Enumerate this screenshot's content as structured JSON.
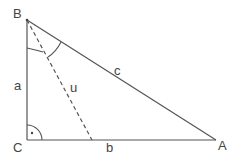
{
  "diagram": {
    "type": "right-triangle",
    "vertices": {
      "B": {
        "label": "B",
        "x": 27,
        "y": 20
      },
      "C": {
        "label": "C",
        "x": 27,
        "y": 140
      },
      "A": {
        "label": "A",
        "x": 216,
        "y": 140
      }
    },
    "sides": {
      "a": {
        "label": "a",
        "from": "B",
        "to": "C"
      },
      "b": {
        "label": "b",
        "from": "C",
        "to": "A"
      },
      "c": {
        "label": "c",
        "from": "B",
        "to": "A"
      }
    },
    "segment_u": {
      "label": "u",
      "from": "B",
      "to_point": {
        "x": 92,
        "y": 140
      },
      "style": "dashed"
    },
    "right_angle_at": "C",
    "angle_arcs_at": "B",
    "colors": {
      "line": "#555555",
      "text": "#444444",
      "background": "#ffffff"
    }
  }
}
